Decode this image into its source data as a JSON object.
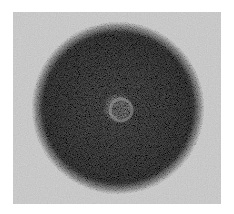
{
  "image": {
    "description": "Grayscale micrograph of a dark stippled circular disc on a light gray background",
    "colors": {
      "page_background": "#ffffff",
      "panel_background": "#d9d9d9",
      "disc_dark": "#3a3a3a",
      "disc_mid": "#6a6a6a",
      "center_ring": "#9a9a9a"
    },
    "disc": {
      "cx": 105,
      "cy": 96,
      "r": 86
    }
  }
}
